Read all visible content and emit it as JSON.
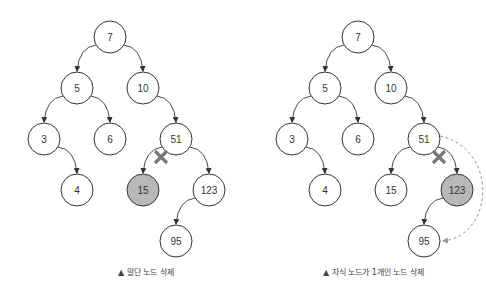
{
  "figures": [
    {
      "id": "leaf-delete",
      "caption": "▲ 말단 노드 삭제",
      "nodes": [
        {
          "value": "7",
          "x": 110,
          "y": 37,
          "deleted": false
        },
        {
          "value": "5",
          "x": 77,
          "y": 88,
          "deleted": false
        },
        {
          "value": "10",
          "x": 143,
          "y": 88,
          "deleted": false
        },
        {
          "value": "3",
          "x": 44,
          "y": 139,
          "deleted": false
        },
        {
          "value": "6",
          "x": 110,
          "y": 139,
          "deleted": false
        },
        {
          "value": "51",
          "x": 176,
          "y": 139,
          "deleted": false
        },
        {
          "value": "4",
          "x": 77,
          "y": 190,
          "deleted": false
        },
        {
          "value": "15",
          "x": 143,
          "y": 190,
          "deleted": true
        },
        {
          "value": "123",
          "x": 209,
          "y": 190,
          "deleted": false
        },
        {
          "value": "95",
          "x": 176,
          "y": 241,
          "deleted": false
        }
      ],
      "edges": [
        [
          "7",
          "5"
        ],
        [
          "7",
          "10"
        ],
        [
          "5",
          "3"
        ],
        [
          "5",
          "6"
        ],
        [
          "10",
          "51"
        ],
        [
          "3",
          "4"
        ],
        [
          "51",
          "15"
        ],
        [
          "51",
          "123"
        ],
        [
          "123",
          "95"
        ]
      ],
      "cut_edge": [
        "51",
        "15"
      ]
    },
    {
      "id": "one-child-delete",
      "caption": "▲ 자식 노드가 1개인 노드 삭제",
      "nodes": [
        {
          "value": "7",
          "x": 358,
          "y": 37,
          "deleted": false
        },
        {
          "value": "5",
          "x": 325,
          "y": 88,
          "deleted": false
        },
        {
          "value": "10",
          "x": 391,
          "y": 88,
          "deleted": false
        },
        {
          "value": "3",
          "x": 292,
          "y": 139,
          "deleted": false
        },
        {
          "value": "6",
          "x": 358,
          "y": 139,
          "deleted": false
        },
        {
          "value": "51",
          "x": 424,
          "y": 139,
          "deleted": false
        },
        {
          "value": "4",
          "x": 325,
          "y": 190,
          "deleted": false
        },
        {
          "value": "15",
          "x": 391,
          "y": 190,
          "deleted": false
        },
        {
          "value": "123",
          "x": 457,
          "y": 190,
          "deleted": true
        },
        {
          "value": "95",
          "x": 424,
          "y": 241,
          "deleted": false
        }
      ],
      "edges": [
        [
          "7",
          "5"
        ],
        [
          "7",
          "10"
        ],
        [
          "5",
          "3"
        ],
        [
          "5",
          "6"
        ],
        [
          "10",
          "51"
        ],
        [
          "3",
          "4"
        ],
        [
          "51",
          "15"
        ],
        [
          "51",
          "123"
        ],
        [
          "123",
          "95"
        ]
      ],
      "cut_edge": [
        "51",
        "123"
      ],
      "reconnect": [
        "51",
        "95"
      ]
    }
  ],
  "colors": {
    "stroke": "#333333",
    "deleted_fill": "#b8b8b8",
    "cross": "#777777",
    "dashed": "#999999"
  }
}
